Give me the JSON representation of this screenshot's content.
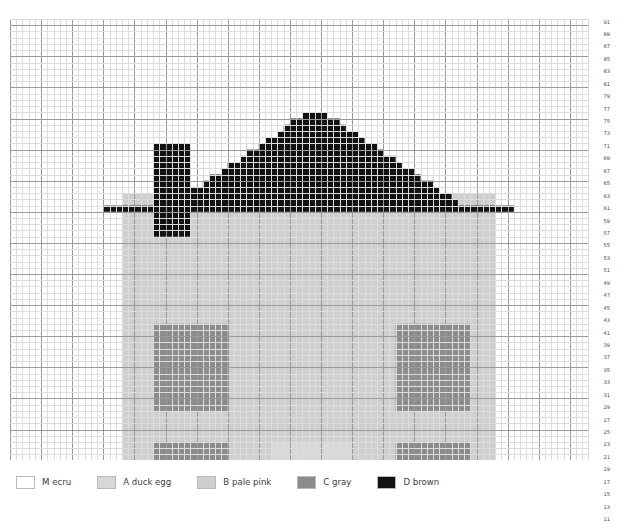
{
  "chart_data": {
    "type": "heatmap",
    "title": "",
    "subtitle": "",
    "xlabel": "",
    "ylabel": "",
    "grid": true,
    "legend_position": "bottom-left",
    "columns": 93,
    "rows": 91,
    "cell_size_px": 6.22,
    "major_gridline_every": 5,
    "grid_minor_color": "#dcdcdc",
    "grid_major_color": "#9a9a9a",
    "x_tick_labels": [],
    "y_tick_labels": [
      "91",
      "89",
      "87",
      "85",
      "83",
      "81",
      "79",
      "77",
      "75",
      "73",
      "71",
      "69",
      "67",
      "65",
      "63",
      "61",
      "59",
      "57",
      "55",
      "53",
      "51",
      "49",
      "47",
      "45",
      "43",
      "41",
      "39",
      "37",
      "35",
      "33",
      "31",
      "29",
      "27",
      "25",
      "23",
      "21",
      "19",
      "17",
      "15",
      "13",
      "11",
      "9",
      "7",
      "5",
      "3",
      "1"
    ],
    "palette": {
      "M": "#ffffff",
      "A": "#d8d8d8",
      "B": "#cfcfcf",
      "C": "#8c8c8c",
      "D": "#121212"
    },
    "regions": [
      {
        "symbol": "B",
        "name": "house-wall",
        "shape": "rect",
        "x0": 18,
        "x1": 77,
        "y0": 6,
        "y1": 63
      },
      {
        "symbol": "C",
        "name": "window-upper-left",
        "shape": "rect",
        "x0": 23,
        "x1": 34,
        "y0": 29,
        "y1": 42
      },
      {
        "symbol": "C",
        "name": "window-upper-right",
        "shape": "rect",
        "x0": 62,
        "x1": 73,
        "y0": 29,
        "y1": 42
      },
      {
        "symbol": "C",
        "name": "window-lower-left",
        "shape": "rect",
        "x0": 23,
        "x1": 34,
        "y0": 10,
        "y1": 23
      },
      {
        "symbol": "C",
        "name": "window-lower-right",
        "shape": "rect",
        "x0": 62,
        "x1": 73,
        "y0": 10,
        "y1": 23
      },
      {
        "symbol": "A",
        "name": "front-door",
        "shape": "rect",
        "x0": 42,
        "x1": 54,
        "y0": 4,
        "y1": 23
      },
      {
        "symbol": "D",
        "name": "chimney",
        "shape": "rect",
        "x0": 23,
        "x1": 28,
        "y0": 57,
        "y1": 71
      },
      {
        "symbol": "D",
        "name": "roof",
        "shape": "gable",
        "apex_x": 48,
        "apex_y": 76,
        "left_x": 15,
        "right_x": 80,
        "eave_y": 63
      }
    ],
    "roof_rows": [
      {
        "row": 76,
        "x0": 47,
        "x1": 50
      },
      {
        "row": 75,
        "x0": 45,
        "x1": 52
      },
      {
        "row": 74,
        "x0": 44,
        "x1": 53
      },
      {
        "row": 73,
        "x0": 43,
        "x1": 55
      },
      {
        "row": 72,
        "x0": 41,
        "x1": 56
      },
      {
        "row": 71,
        "x0": 40,
        "x1": 58
      },
      {
        "row": 70,
        "x0": 38,
        "x1": 59
      },
      {
        "row": 69,
        "x0": 37,
        "x1": 61
      },
      {
        "row": 68,
        "x0": 35,
        "x1": 62
      },
      {
        "row": 67,
        "x0": 34,
        "x1": 64
      },
      {
        "row": 66,
        "x0": 32,
        "x1": 65
      },
      {
        "row": 65,
        "x0": 31,
        "x1": 67
      },
      {
        "row": 64,
        "x0": 29,
        "x1": 68
      },
      {
        "row": 63,
        "x0": 28,
        "x1": 70
      },
      {
        "row": 62,
        "x0": 26,
        "x1": 71
      },
      {
        "row": 61,
        "x0": 15,
        "x1": 80
      }
    ]
  },
  "legend": {
    "items": [
      {
        "symbol": "M",
        "label": "M ecru",
        "color": "#ffffff"
      },
      {
        "symbol": "A",
        "label": "A duck egg",
        "color": "#d8d8d8"
      },
      {
        "symbol": "B",
        "label": "B pale pink",
        "color": "#cfcfcf"
      },
      {
        "symbol": "C",
        "label": "C gray",
        "color": "#8c8c8c"
      },
      {
        "symbol": "D",
        "label": "D brown",
        "color": "#121212"
      }
    ]
  }
}
